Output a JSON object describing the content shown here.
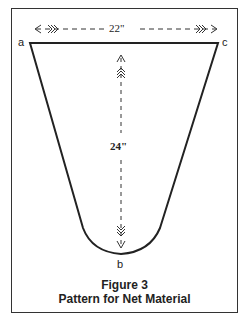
{
  "figure": {
    "number_label": "Figure 3",
    "caption": "Pattern for Net Material"
  },
  "points": {
    "a": "a",
    "b": "b",
    "c": "c"
  },
  "dimensions": {
    "width": "22\"",
    "height": "24\""
  },
  "colors": {
    "line": "#222222",
    "background": "#ffffff"
  }
}
